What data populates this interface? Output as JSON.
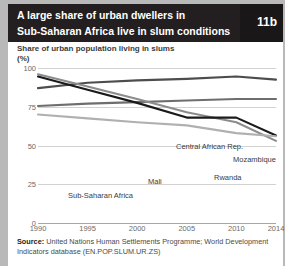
{
  "figure": {
    "title": "A large share of urban dwellers in Sub-Saharan Africa live in slum conditions",
    "title_line1": "A large share of urban dwellers in",
    "title_line2": "Sub-Saharan Africa live in slum conditions",
    "badge": "11b",
    "subtitle": "Share of urban population living in slums",
    "unit": "(%)",
    "source_label": "Source:",
    "source_text": " United Nations Human Settlements Programme; World Development Indicators database (EN.POP.SLUM.UR.ZS)"
  },
  "colors": {
    "title_background": "#231f20",
    "badge_background": "#1a1718",
    "title_text": "#ffffff",
    "gridline": "#d2d2d2",
    "axis": "#a6a6a6",
    "label_text": "#3b3b3b",
    "tick_text": "#6a6a6a",
    "central_african_rep": "#4d4d4d",
    "mozambique": "#6e6e6e",
    "rwanda": "#8c8c8c",
    "mali": "#1a1a1a",
    "sub_saharan_africa": "#b0b0b0"
  },
  "chart_data": {
    "type": "line",
    "title": "Share of urban population living in slums (%)",
    "xlabel": "",
    "ylabel": "(%)",
    "ylim": [
      0,
      100
    ],
    "yticks": [
      0,
      25,
      50,
      75,
      100
    ],
    "xlim": [
      1990,
      2014
    ],
    "xticks": [
      1990,
      1995,
      2000,
      2005,
      2010,
      2014
    ],
    "xtick_labels": [
      "1990",
      "1995",
      "2000",
      "2005",
      "2010",
      "2014"
    ],
    "grid": true,
    "legend": "inline-labels",
    "x": [
      1990,
      1995,
      2000,
      2005,
      2010,
      2014
    ],
    "series": [
      {
        "name": "Central African Rep.",
        "color": "#4d4d4d",
        "values": [
          87.0,
          90.5,
          92.0,
          93.0,
          94.5,
          92.5
        ],
        "label_x": 168,
        "label_y": 82
      },
      {
        "name": "Mozambique",
        "color": "#6e6e6e",
        "values": [
          75.5,
          77.0,
          78.0,
          79.0,
          80.0,
          80.0
        ],
        "label_x": 225,
        "label_y": 95
      },
      {
        "name": "Rwanda",
        "color": "#8c8c8c",
        "values": [
          96.0,
          88.0,
          80.0,
          71.5,
          65.0,
          53.0
        ],
        "label_x": 206,
        "label_y": 113
      },
      {
        "name": "Mali",
        "color": "#1a1a1a",
        "values": [
          94.5,
          86.0,
          77.5,
          68.0,
          68.0,
          56.5
        ],
        "label_x": 140,
        "label_y": 117
      },
      {
        "name": "Sub-Saharan Africa",
        "color": "#b0b0b0",
        "values": [
          70.0,
          67.5,
          65.0,
          63.0,
          58.0,
          56.0
        ],
        "label_x": 60,
        "label_y": 131
      }
    ]
  }
}
